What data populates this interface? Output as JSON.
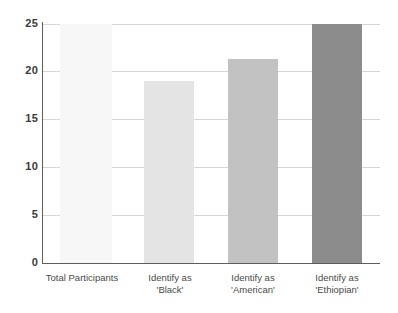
{
  "chart_data": {
    "type": "bar",
    "title": "",
    "subtitle": "",
    "xlabel": "",
    "ylabel": "",
    "ylim": [
      0,
      25
    ],
    "yticks": [
      0,
      5,
      10,
      15,
      20,
      25
    ],
    "ytick_labels": [
      "0",
      "5",
      "10",
      "15",
      "20",
      "25"
    ],
    "grid": "horizontal",
    "legend": "none",
    "categories": [
      "Total Participants",
      "Identify as 'Black'",
      "Identify as 'American'",
      "Identify as 'Ethiopian'"
    ],
    "category_lines": [
      [
        "Total Participants",
        ""
      ],
      [
        "Identify as",
        "'Black'"
      ],
      [
        "Identify as",
        "'American'"
      ],
      [
        "Identify as",
        "'Ethiopian'"
      ]
    ],
    "values": [
      25,
      19,
      21.3,
      25
    ],
    "bar_colors": [
      "#f7f7f7",
      "#e4e4e4",
      "#c2c2c2",
      "#8c8c8c"
    ],
    "axis_color": "#5d5d5d",
    "gridline_color": "#d6d6d6",
    "background_color": "#ffffff"
  }
}
